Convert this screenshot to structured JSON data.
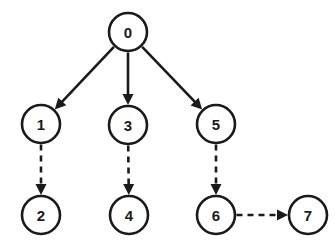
{
  "diagram": {
    "background_color": "#ffffff",
    "stroke_color": "#1a1a1a",
    "node_radius": 19,
    "nodes": [
      {
        "id": "0",
        "label": "0",
        "x": 128,
        "y": 32
      },
      {
        "id": "1",
        "label": "1",
        "x": 41,
        "y": 124
      },
      {
        "id": "3",
        "label": "3",
        "x": 128,
        "y": 125
      },
      {
        "id": "5",
        "label": "5",
        "x": 216,
        "y": 124
      },
      {
        "id": "2",
        "label": "2",
        "x": 41,
        "y": 215
      },
      {
        "id": "4",
        "label": "4",
        "x": 129,
        "y": 215
      },
      {
        "id": "6",
        "label": "6",
        "x": 216,
        "y": 215
      },
      {
        "id": "7",
        "label": "7",
        "x": 308,
        "y": 215
      }
    ],
    "edges": [
      {
        "id": "e0-1",
        "from": "0",
        "to": "1",
        "style": "solid",
        "arrow": true
      },
      {
        "id": "e0-3",
        "from": "0",
        "to": "3",
        "style": "solid",
        "arrow": true
      },
      {
        "id": "e0-5",
        "from": "0",
        "to": "5",
        "style": "solid",
        "arrow": true
      },
      {
        "id": "e1-2",
        "from": "1",
        "to": "2",
        "style": "dashed",
        "arrow": true
      },
      {
        "id": "e3-4",
        "from": "3",
        "to": "4",
        "style": "dashed",
        "arrow": true
      },
      {
        "id": "e5-6",
        "from": "5",
        "to": "6",
        "style": "dashed",
        "arrow": true
      },
      {
        "id": "e6-7",
        "from": "6",
        "to": "7",
        "style": "dashed",
        "arrow": true
      }
    ]
  }
}
